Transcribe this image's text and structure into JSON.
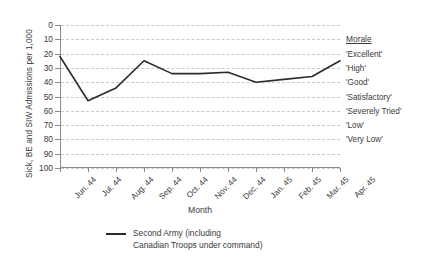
{
  "chart_data": {
    "type": "line",
    "title": "",
    "xlabel": "Month",
    "ylabel": "Sick, BE and SIW Admissions per 1,000",
    "categories": [
      "Jun. 44",
      "Jul. 44",
      "Aug. 44",
      "Sep. 44",
      "Oct. 44",
      "Nov. 44",
      "Dec. 44",
      "Jan. 45",
      "Feb. 45",
      "Mar. 45",
      "Apr. 45"
    ],
    "series": [
      {
        "name": "Second Army (including\nCanadian Troops under command)",
        "values": [
          22,
          53,
          44,
          25,
          34,
          34,
          33,
          40,
          38,
          36,
          25
        ],
        "color": "#2b2b2b"
      }
    ],
    "ylim": [
      0,
      100
    ],
    "y_inverted": true,
    "yticks": [
      0,
      10,
      20,
      30,
      40,
      50,
      60,
      70,
      80,
      90,
      100
    ],
    "ytick_labels": [
      "0",
      "10",
      "20",
      "30",
      "40",
      "50",
      "60",
      "70",
      "80",
      "90",
      "100"
    ],
    "grid": true,
    "grid_color": "#c9c9c9",
    "grid_style": "dashed",
    "axis_color": "#8a8a8a",
    "legend_position": "bottom-center"
  },
  "morale": {
    "title": "Morale",
    "items": [
      {
        "label": "'Excellent'",
        "value": 20
      },
      {
        "label": "'High'",
        "value": 30
      },
      {
        "label": "'Good'",
        "value": 40
      },
      {
        "label": "'Satisfactory'",
        "value": 50
      },
      {
        "label": "'Severely Tried'",
        "value": 60
      },
      {
        "label": "'Low'",
        "value": 70
      },
      {
        "label": "'Very Low'",
        "value": 80
      }
    ],
    "title_value": 10
  },
  "legend": {
    "label": "Second Army (including\nCanadian Troops under command)"
  }
}
